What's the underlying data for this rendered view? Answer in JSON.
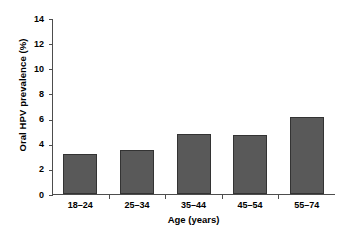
{
  "chart_data": {
    "type": "bar",
    "title": "",
    "xlabel": "Age (years)",
    "ylabel": "Oral HPV prevalence (%)",
    "categories": [
      "18–24",
      "25–34",
      "35–44",
      "45–54",
      "55–74"
    ],
    "values": [
      3.2,
      3.5,
      4.8,
      4.7,
      6.1
    ],
    "ylim": [
      0,
      14
    ],
    "yticks": [
      0,
      2,
      4,
      6,
      8,
      10,
      12,
      14
    ],
    "ytick_labels": [
      "0",
      "2",
      "4",
      "6",
      "8",
      "10",
      "12",
      "14"
    ],
    "grid": false,
    "legend": false,
    "bar_color": "#595959",
    "bar_edge_color": "#333333",
    "axis_color": "#4d4d4d",
    "background_color": "#ffffff"
  }
}
